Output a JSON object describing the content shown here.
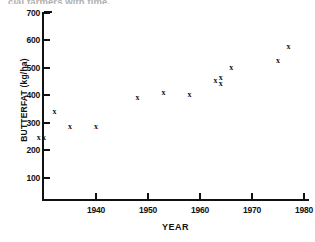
{
  "caption": {
    "text": "cial farmers with time."
  },
  "chart_data": {
    "type": "scatter",
    "title": "",
    "xlabel": "YEAR",
    "ylabel": "BUTTERFAT (kg/ha)",
    "xlim": [
      1928,
      1982
    ],
    "ylim": [
      0,
      700
    ],
    "xticks": [
      1940,
      1950,
      1960,
      1970,
      1980
    ],
    "xticklabels": [
      "1940",
      "1950",
      "1960",
      "1970",
      "1980"
    ],
    "yticks": [
      100,
      200,
      300,
      400,
      500,
      600,
      700
    ],
    "yticklabels": [
      "100",
      "200",
      "300",
      "400",
      "500",
      "600",
      "700"
    ],
    "grid": false,
    "legend": null,
    "marker": "x",
    "series": [
      {
        "name": "Butterfat production",
        "points": [
          {
            "x": 1929,
            "y": 245
          },
          {
            "x": 1930,
            "y": 245
          },
          {
            "x": 1932,
            "y": 337
          },
          {
            "x": 1935,
            "y": 283
          },
          {
            "x": 1940,
            "y": 283
          },
          {
            "x": 1948,
            "y": 390
          },
          {
            "x": 1953,
            "y": 408
          },
          {
            "x": 1958,
            "y": 400
          },
          {
            "x": 1963,
            "y": 450
          },
          {
            "x": 1964,
            "y": 462
          },
          {
            "x": 1964,
            "y": 440
          },
          {
            "x": 1966,
            "y": 500
          },
          {
            "x": 1975,
            "y": 525
          },
          {
            "x": 1977,
            "y": 575
          }
        ]
      }
    ]
  }
}
